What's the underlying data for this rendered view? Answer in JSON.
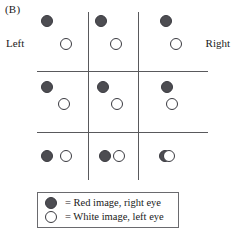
{
  "figure": {
    "panel_label": "(B)",
    "left_label": "Left",
    "right_label": "Right"
  },
  "legend": {
    "items": [
      {
        "symbol": "filled-circle",
        "text": "= Red image, right eye"
      },
      {
        "symbol": "open-circle",
        "text": "= White image, left eye"
      }
    ]
  },
  "colors": {
    "red_image_fill": "#4d4d52",
    "white_image_fill": "#ffffff",
    "outline": "#3a3a40",
    "rule": "#59595c",
    "legend_border": "#6a6a6e",
    "background": "#ffffff",
    "text": "#1a1a1a"
  },
  "chart_data": {
    "type": "scatter",
    "title": "(B)",
    "xlabel": "",
    "ylabel": "",
    "grid": true,
    "axis_annotations": {
      "left": "Left",
      "right": "Right"
    },
    "grid_lines": {
      "vertical_x": [
        88,
        138
      ],
      "horizontal_y": [
        71,
        132
      ],
      "x_extent": [
        37,
        208
      ],
      "y_extent": [
        12,
        180
      ]
    },
    "legend_position": "bottom-left",
    "series": [
      {
        "name": "Red image, right eye",
        "symbol": "filled-circle"
      },
      {
        "name": "White image, left eye",
        "symbol": "open-circle"
      }
    ],
    "cells": [
      {
        "row": 1,
        "col": 1,
        "red": [
          47,
          21
        ],
        "white": [
          66,
          44
        ],
        "separation": [
          19,
          23
        ],
        "fused": false
      },
      {
        "row": 1,
        "col": 2,
        "red": [
          101,
          21
        ],
        "white": [
          116,
          44
        ],
        "separation": [
          15,
          23
        ],
        "fused": false
      },
      {
        "row": 1,
        "col": 3,
        "red": [
          166,
          21
        ],
        "white": [
          176,
          44
        ],
        "separation": [
          10,
          23
        ],
        "fused": false
      },
      {
        "row": 2,
        "col": 1,
        "red": [
          47,
          87
        ],
        "white": [
          64,
          104
        ],
        "separation": [
          17,
          17
        ],
        "fused": false
      },
      {
        "row": 2,
        "col": 2,
        "red": [
          103,
          87
        ],
        "white": [
          117,
          104
        ],
        "separation": [
          14,
          17
        ],
        "fused": false
      },
      {
        "row": 2,
        "col": 3,
        "red": [
          167,
          87
        ],
        "white": [
          172,
          104
        ],
        "separation": [
          5,
          17
        ],
        "fused": false
      },
      {
        "row": 3,
        "col": 1,
        "red": [
          47,
          156
        ],
        "white": [
          66,
          156
        ],
        "separation": [
          19,
          0
        ],
        "fused": false
      },
      {
        "row": 3,
        "col": 2,
        "red": [
          105,
          156
        ],
        "white": [
          119,
          156
        ],
        "separation": [
          14,
          0
        ],
        "fused": false
      },
      {
        "row": 3,
        "col": 3,
        "red": [
          165,
          156
        ],
        "white": [
          169,
          156
        ],
        "separation": [
          4,
          0
        ],
        "fused": true
      }
    ]
  }
}
